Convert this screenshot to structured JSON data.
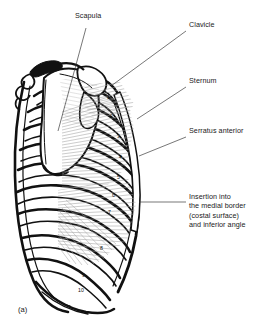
{
  "figure": {
    "caption": "(a)",
    "kind": "anatomical-illustration",
    "background_color": "#ffffff",
    "ink_color": "#111111",
    "muscle_fiber_color": "#9a9a9a",
    "leader_line_color": "#3c3c3c"
  },
  "labels": [
    {
      "name": "scapula",
      "text": "Scapula",
      "x": 75,
      "y": 16,
      "leader": {
        "x1": 86,
        "y1": 28,
        "x2": 58,
        "y2": 131
      }
    },
    {
      "name": "clavicle",
      "text": "Clavicle",
      "x": 189,
      "y": 25,
      "leader": {
        "x1": 186,
        "y1": 31,
        "x2": 111,
        "y2": 86
      }
    },
    {
      "name": "sternum",
      "text": "Sternum",
      "x": 189,
      "y": 81,
      "leader": {
        "x1": 186,
        "y1": 87,
        "x2": 137,
        "y2": 119
      }
    },
    {
      "name": "serratus-anterior",
      "text": "Serratus anterior",
      "x": 189,
      "y": 131,
      "leader": {
        "x1": 186,
        "y1": 137,
        "x2": 139,
        "y2": 156
      }
    },
    {
      "name": "insertion",
      "lines": [
        "Insertion into",
        "the medial border",
        "(costal surface)",
        "and inferior angle"
      ],
      "x": 189,
      "y": 196,
      "leader": {
        "x1": 186,
        "y1": 202,
        "x2": 139,
        "y2": 202
      }
    }
  ],
  "rib_numbers": [
    {
      "label": "1",
      "x": 107,
      "y": 98
    },
    {
      "label": "2",
      "x": 110,
      "y": 117
    },
    {
      "label": "3",
      "x": 117,
      "y": 137
    },
    {
      "label": "4",
      "x": 119,
      "y": 158
    },
    {
      "label": "5",
      "x": 117,
      "y": 178
    },
    {
      "label": "6",
      "x": 112,
      "y": 196
    },
    {
      "label": "7",
      "x": 108,
      "y": 213
    },
    {
      "label": "8",
      "x": 100,
      "y": 249
    },
    {
      "label": "9",
      "x": 82,
      "y": 276
    },
    {
      "label": "10",
      "x": 78,
      "y": 291
    }
  ]
}
